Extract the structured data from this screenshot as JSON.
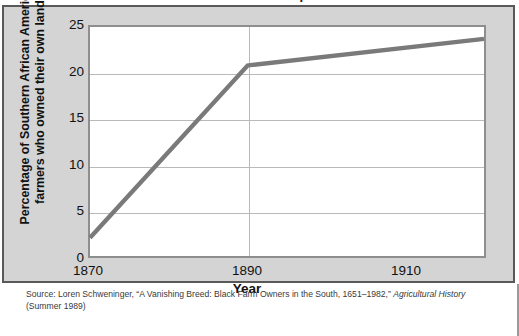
{
  "figure": {
    "cropped_title": "Landownership",
    "panel_bg": "#d4d4d4",
    "panel_border": "#595959",
    "plot_bg": "#ffffff",
    "plot_border": "#8e8e8e",
    "gridline_color": "#b9b9b9",
    "series_color": "#7a7a7a"
  },
  "source_note": {
    "line1_pre": "Source: Loren Schweninger, “A Vanishing Breed: Black Farm Owners in the South, 1651–1982,” ",
    "line1_italic": "Agricultural History",
    "line2": "(Summer 1989)"
  },
  "chart_data": {
    "type": "line",
    "title": "Landownership",
    "xlabel": "Year",
    "ylabel": "Percentage of Southern African American farmers who owned their own land",
    "ylabel_lines": [
      "Percentage of Southern African American",
      "farmers who owned their own land"
    ],
    "xlim": [
      1870,
      1920
    ],
    "ylim": [
      0,
      25
    ],
    "yticks": [
      0,
      5,
      10,
      15,
      20,
      25
    ],
    "ytick_labels": [
      "0",
      "5",
      "10",
      "15",
      "20",
      "25"
    ],
    "xticks": [
      1870,
      1890,
      1910
    ],
    "xtick_labels": [
      "1870",
      "1890",
      "1910"
    ],
    "grid": {
      "horizontal": true,
      "vertical_at": [
        1890
      ]
    },
    "legend": null,
    "series": [
      {
        "name": "Percentage of Southern African American farmers who owned their own land",
        "color": "#7a7a7a",
        "line_width": 4,
        "x": [
          1870,
          1890,
          1920
        ],
        "values": [
          2.0,
          20.8,
          23.7
        ]
      }
    ],
    "annotations": []
  }
}
